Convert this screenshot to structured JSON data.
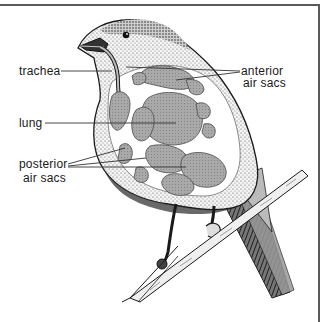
{
  "diagram": {
    "labels": {
      "trachea": "trachea",
      "lung": "lung",
      "posterior_line1": "posterior",
      "posterior_line2": "air sacs",
      "anterior_line1": "anterior",
      "anterior_line2": "air sacs"
    },
    "colors": {
      "frame": "#5a5a5a",
      "ink": "#1a1a1a",
      "organ_fill": "#a8a8a8",
      "organ_stroke": "#555555",
      "body_fill": "#f2f2f2"
    }
  }
}
